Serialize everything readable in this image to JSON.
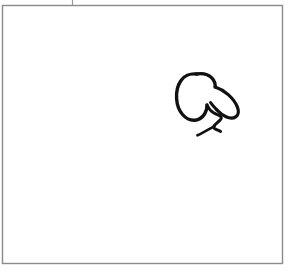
{
  "canvas": {
    "width": 290,
    "height": 270,
    "background_color": "#ffffff",
    "title": "sketch-canvas"
  },
  "frame": {
    "name": "drawing-frame",
    "x": 2.5,
    "y": 5.5,
    "width": 280,
    "height": 258,
    "stroke_color": "#8a8a8a",
    "stroke_width": 1.4,
    "fill": "none"
  },
  "tick_mark": {
    "name": "top-tick-mark",
    "x": 72.5,
    "y_top": 0,
    "y_bottom": 5,
    "stroke_color": "#9a9a9a",
    "stroke_width": 1.2
  },
  "sketch": {
    "name": "hand-drawn-blob",
    "stroke_color": "#111111",
    "fill": "none",
    "bounds": {
      "x": 176,
      "y": 72,
      "width": 63,
      "height": 64
    },
    "strokes": [
      {
        "name": "blob-outline",
        "stroke_width": 3.4,
        "path": "M 196.5 74.0 C 190.0 73.2 184.0 76.0 181.0 80.5 C 177.5 85.5 176.2 92.0 176.6 98.5 C 177.0 105.0 179.0 110.5 182.5 114.5 C 186.0 118.5 190.5 120.6 195.0 120.2 C 199.0 119.8 202.4 117.4 204.6 114.0 C 206.4 111.2 207.2 108.0 207.0 105.0"
      },
      {
        "name": "blob-top-right-arc",
        "stroke_width": 3.4,
        "path": "M 196.5 74.0 C 203.0 73.0 208.6 74.6 212.0 78.2 C 214.4 80.8 215.4 84.0 215.2 87.0"
      },
      {
        "name": "blob-right-flank",
        "stroke_width": 3.2,
        "path": "M 215.2 87.0 C 219.5 88.4 224.2 91.0 228.2 94.6 C 232.6 98.5 236.0 103.2 237.6 107.6 C 239.0 111.6 238.4 114.8 236.0 116.6 C 233.4 118.6 229.6 118.4 226.0 116.8 C 222.4 115.2 219.2 112.4 216.6 109.6"
      },
      {
        "name": "blob-inner-notch",
        "stroke_width": 3.0,
        "path": "M 216.6 109.6 C 214.0 107.0 212.0 104.6 210.6 102.6"
      },
      {
        "name": "foot-zigzag",
        "stroke_width": 3.0,
        "path": "M 207.0 105.0 C 208.4 108.2 210.6 111.0 213.6 112.8 C 216.2 114.4 218.8 115.0 220.4 116.2 C 221.8 117.2 221.6 118.6 219.8 120.4 C 218.0 122.2 215.4 124.0 214.2 125.6 C 213.2 127.0 213.8 128.2 215.6 129.2 C 217.2 130.0 219.4 130.6 220.6 131.4"
      },
      {
        "name": "foot-lower-tail",
        "stroke_width": 2.6,
        "path": "M 214.6 126.2 C 211.0 128.2 206.6 130.6 202.8 132.6 C 200.4 133.9 198.6 134.8 197.4 135.3"
      }
    ]
  }
}
